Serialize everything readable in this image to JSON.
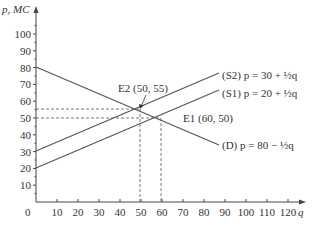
{
  "chart_data": {
    "type": "line",
    "title": "",
    "xlabel": "q",
    "ylabel": "p, MC",
    "xlim": [
      0,
      125
    ],
    "ylim": [
      0,
      105
    ],
    "x_ticks": [
      0,
      10,
      20,
      30,
      40,
      50,
      60,
      70,
      80,
      90,
      100,
      110,
      120
    ],
    "y_ticks": [
      10,
      20,
      30,
      40,
      50,
      60,
      70,
      80,
      90,
      100
    ],
    "grid": false,
    "series": [
      {
        "name": "(D) p = 80 − ½q",
        "x": [
          0,
          120
        ],
        "y": [
          80,
          20
        ]
      },
      {
        "name": "(S1) p = 20 + ½q",
        "x": [
          0,
          120
        ],
        "y": [
          20,
          80
        ]
      },
      {
        "name": "(S2) p = 30 + ½q",
        "x": [
          0,
          120
        ],
        "y": [
          30,
          90
        ]
      }
    ],
    "annotations": [
      {
        "label": "E1 (60, 50)",
        "x": 60,
        "y": 50
      },
      {
        "label": "E2 (50, 55)",
        "x": 50,
        "y": 55
      }
    ]
  },
  "labels": {
    "ylabel": "p, MC",
    "xlabel": "q",
    "origin": "0",
    "s2": "(S2) p = 30 + ½q",
    "s1": "(S1) p = 20 + ½q",
    "d": "(D) p = 80 − ½q",
    "e1": "E1 (60, 50)",
    "e2": "E2 (50, 55)"
  }
}
